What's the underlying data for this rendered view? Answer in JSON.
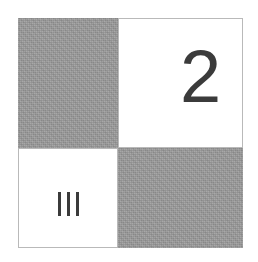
{
  "figure": {
    "type": "quadrant-grid",
    "rows": 2,
    "columns": 2,
    "colors": {
      "gray_fill": "#9a9a9a",
      "white_fill": "#ffffff",
      "glyph_color": "#3b3b3b",
      "border": "#b9b9b9",
      "background": "#ffffff"
    },
    "cells": [
      {
        "position": "top-left",
        "fill": "gray",
        "fill_color": "#9a9a9a",
        "label": "",
        "label_kind": "none"
      },
      {
        "position": "top-right",
        "fill": "white",
        "fill_color": "#ffffff",
        "label": "2",
        "label_kind": "arabic-numeral"
      },
      {
        "position": "bottom-left",
        "fill": "white",
        "fill_color": "#ffffff",
        "label": "III",
        "label_kind": "roman-numeral",
        "stroke_count": 3
      },
      {
        "position": "bottom-right",
        "fill": "gray",
        "fill_color": "#9a9a9a",
        "label": "",
        "label_kind": "none"
      }
    ]
  }
}
